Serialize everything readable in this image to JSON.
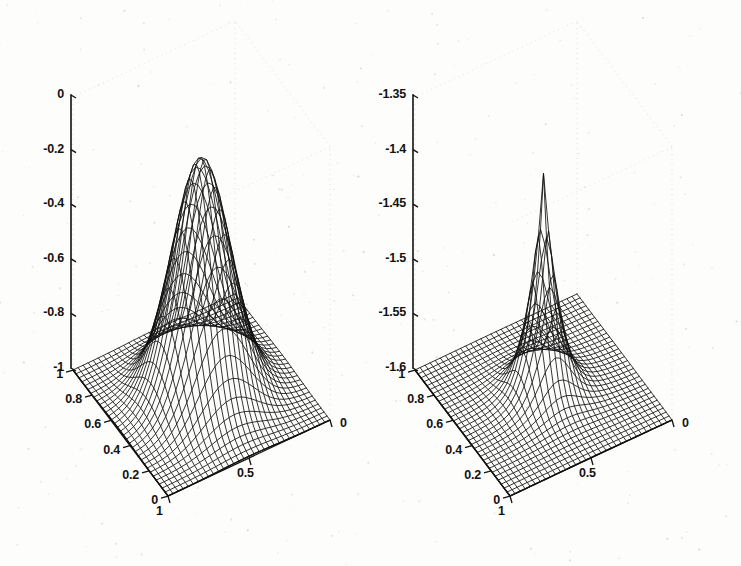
{
  "figure": {
    "background_color": "#fdfdfc",
    "ink_color": "#111111",
    "scan_artifact_color": "#b9b9b9",
    "width": 741,
    "height": 566,
    "panel_count": 2
  },
  "chart_data": [
    {
      "id": "left-surface-plot",
      "type": "surface",
      "title": "",
      "subtitle": "",
      "xlabel": "",
      "ylabel": "",
      "zlabel": "",
      "grid": false,
      "legend": null,
      "projection": "3d-mesh",
      "mesh_style": "wireframe",
      "mesh_nx": 33,
      "mesh_ny": 33,
      "surface_form": "negative-gaussian-bump",
      "peak_value": -0.13,
      "floor_value": -1.0,
      "peak_x": 0.5,
      "peak_y": 0.5,
      "sigma_x": 0.16,
      "sigma_y": 0.16,
      "xlim": [
        0,
        1
      ],
      "ylim": [
        0,
        1
      ],
      "zlim": [
        -1,
        0
      ],
      "x_ticks": [
        1,
        0.5,
        0
      ],
      "x_tick_labels": [
        "1",
        "0.5",
        "0"
      ],
      "y_ticks": [
        1,
        0.8,
        0.6,
        0.4,
        0.2,
        0
      ],
      "y_tick_labels": [
        "1",
        "0.8",
        "0.6",
        "0.4",
        "0.2",
        "0"
      ],
      "z_ticks": [
        0,
        -0.2,
        -0.4,
        -0.6,
        -0.8,
        -1
      ],
      "z_tick_labels": [
        "0",
        "-0.2",
        "-0.4",
        "-0.6",
        "-0.8",
        "-1"
      ],
      "view_azimuth": -37.5,
      "view_elevation": 30
    },
    {
      "id": "right-surface-plot",
      "type": "surface",
      "title": "",
      "subtitle": "",
      "xlabel": "",
      "ylabel": "",
      "zlabel": "",
      "grid": false,
      "legend": null,
      "projection": "3d-mesh",
      "mesh_style": "wireframe",
      "mesh_nx": 33,
      "mesh_ny": 33,
      "surface_form": "negative-sharp-peak",
      "peak_value": -1.397,
      "floor_value": -1.6,
      "peak_x": 0.5,
      "peak_y": 0.5,
      "sigma_x": 0.085,
      "sigma_y": 0.085,
      "xlim": [
        0,
        1
      ],
      "ylim": [
        0,
        1
      ],
      "zlim": [
        -1.6,
        -1.35
      ],
      "x_ticks": [
        1,
        0.5,
        0
      ],
      "x_tick_labels": [
        "1",
        "0.5",
        "0"
      ],
      "y_ticks": [
        1,
        0.8,
        0.6,
        0.4,
        0.2,
        0
      ],
      "y_tick_labels": [
        "1",
        "0.8",
        "0.6",
        "0.4",
        "0.2",
        "0"
      ],
      "z_ticks": [
        -1.35,
        -1.4,
        -1.45,
        -1.5,
        -1.55,
        -1.6
      ],
      "z_tick_labels": [
        "-1.35",
        "-1.4",
        "-1.45",
        "-1.5",
        "-1.55",
        "-1.6"
      ],
      "view_azimuth": -37.5,
      "view_elevation": 30
    }
  ],
  "axes_geometry": {
    "left": {
      "z_axis_x": 71,
      "z_axis_top_y": 95,
      "z_axis_bottom_y": 368,
      "origin_corner": [
        73,
        370
      ],
      "front_corner": [
        168,
        496
      ],
      "right_corner": [
        330,
        420
      ],
      "back_corner": [
        234,
        292
      ]
    },
    "right": {
      "z_axis_x": 413,
      "z_axis_top_y": 95,
      "z_axis_bottom_y": 368,
      "origin_corner": [
        415,
        370
      ],
      "front_corner": [
        510,
        496
      ],
      "right_corner": [
        672,
        420
      ],
      "back_corner": [
        576,
        292
      ]
    }
  }
}
